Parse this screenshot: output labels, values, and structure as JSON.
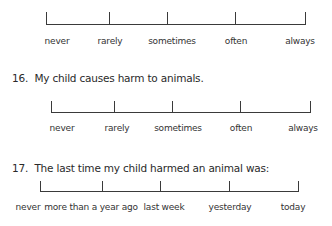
{
  "scale_a": {
    "labels": [
      "never",
      "rarely",
      "sometimes",
      "often",
      "always"
    ]
  },
  "question_16": {
    "number": "16.",
    "text": "My child causes harm to animals.",
    "labels": [
      "never",
      "rarely",
      "sometimes",
      "often",
      "always"
    ]
  },
  "question_17": {
    "number": "17.",
    "text": "The last time my child harmed an animal was:",
    "labels": [
      "never",
      "more than a year ago",
      "last week",
      "yesterday",
      "today"
    ]
  },
  "colors": {
    "line": "#3a3a3a",
    "text": "#2b2b2b",
    "background": "#ffffff"
  }
}
